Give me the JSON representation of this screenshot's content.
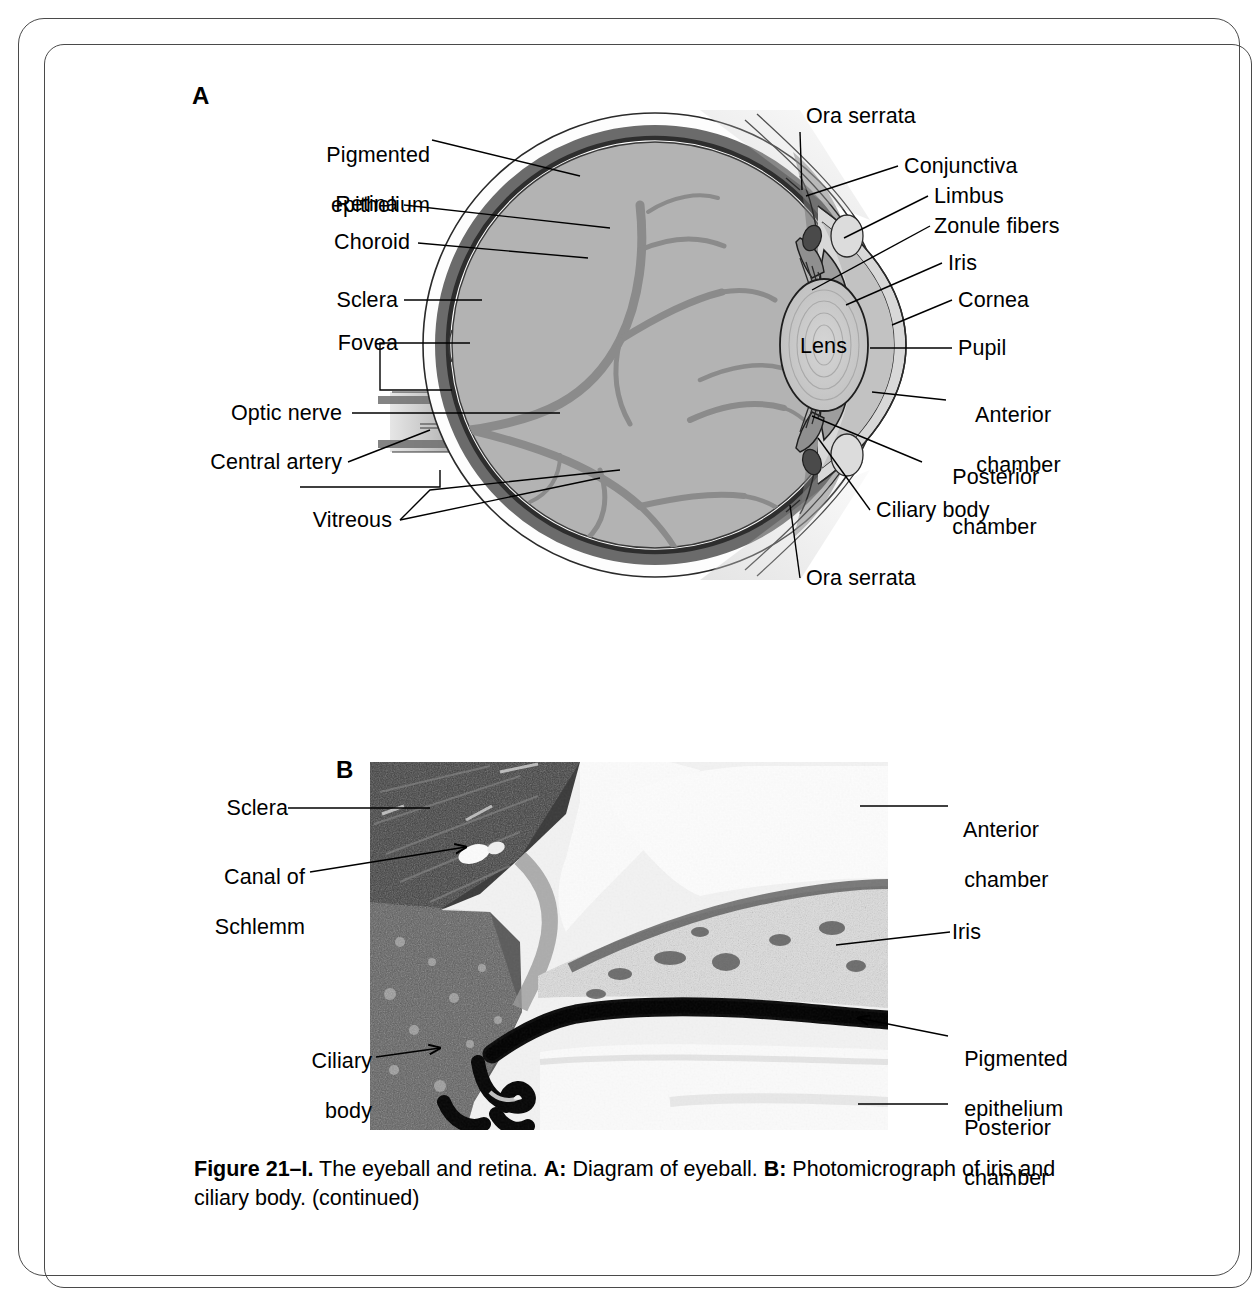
{
  "figure": {
    "panel_a_letter": "A",
    "panel_b_letter": "B",
    "caption_number": "Figure 21–I.",
    "caption_text_1": " The eyeball and retina. ",
    "caption_a_tag": "A:",
    "caption_text_2": " Diagram of eyeball. ",
    "caption_b_tag": "B:",
    "caption_text_3": " Photomicrograph of iris and ciliary body. (continued)"
  },
  "panel_a": {
    "title": "Diagram of eyeball",
    "labels_left": [
      {
        "id": "pigmented-epithelium",
        "line1": "Pigmented",
        "line2": "epithelium"
      },
      {
        "id": "retina",
        "line1": "Retina",
        "line2": ""
      },
      {
        "id": "choroid",
        "line1": "Choroid",
        "line2": ""
      },
      {
        "id": "sclera",
        "line1": "Sclera",
        "line2": ""
      },
      {
        "id": "fovea",
        "line1": "Fovea",
        "line2": ""
      },
      {
        "id": "optic-nerve",
        "line1": "Optic nerve",
        "line2": ""
      },
      {
        "id": "central-artery",
        "line1": "Central artery",
        "line2": ""
      },
      {
        "id": "vitreous",
        "line1": "Vitreous",
        "line2": ""
      }
    ],
    "labels_right": [
      {
        "id": "ora-serrata-top",
        "line1": "Ora serrata",
        "line2": ""
      },
      {
        "id": "conjunctiva",
        "line1": "Conjunctiva",
        "line2": ""
      },
      {
        "id": "limbus",
        "line1": "Limbus",
        "line2": ""
      },
      {
        "id": "zonule-fibers",
        "line1": "Zonule fibers",
        "line2": ""
      },
      {
        "id": "iris",
        "line1": "Iris",
        "line2": ""
      },
      {
        "id": "cornea",
        "line1": "Cornea",
        "line2": ""
      },
      {
        "id": "pupil",
        "line1": "Pupil",
        "line2": ""
      },
      {
        "id": "anterior-chamber",
        "line1": "Anterior",
        "line2": "chamber"
      },
      {
        "id": "posterior-chamber",
        "line1": "Posterior",
        "line2": "chamber"
      },
      {
        "id": "ciliary-body",
        "line1": "Ciliary body",
        "line2": ""
      },
      {
        "id": "ora-serrata-bottom",
        "line1": "Ora serrata",
        "line2": ""
      }
    ],
    "inline_labels": [
      {
        "id": "lens",
        "text": "Lens"
      }
    ],
    "colors": {
      "vitreous": "#b3b3b3",
      "vessel": "#8b8b8b",
      "choroid_dark": "#5f5f5f",
      "pigmented_epithelium": "#3a3a3a",
      "sclera_white": "#fdfdfd",
      "cornea_light": "#d8d8d8",
      "anterior_chamber": "#c2c2c2",
      "lens_fill": "#c9c9c9",
      "outline": "#1a1a1a"
    }
  },
  "panel_b": {
    "title": "Photomicrograph of iris and ciliary body",
    "labels_left": [
      {
        "id": "sclera",
        "line1": "Sclera",
        "line2": ""
      },
      {
        "id": "canal-of-schlemm",
        "line1": "Canal of",
        "line2": "Schlemm"
      },
      {
        "id": "ciliary-body",
        "line1": "Ciliary",
        "line2": "body"
      }
    ],
    "labels_right": [
      {
        "id": "anterior-chamber",
        "line1": "Anterior",
        "line2": "chamber"
      },
      {
        "id": "iris",
        "line1": "Iris",
        "line2": ""
      },
      {
        "id": "pigmented-epithelium",
        "line1": "Pigmented",
        "line2": "epithelium"
      },
      {
        "id": "posterior-chamber",
        "line1": "Posterior",
        "line2": "chamber"
      }
    ]
  }
}
